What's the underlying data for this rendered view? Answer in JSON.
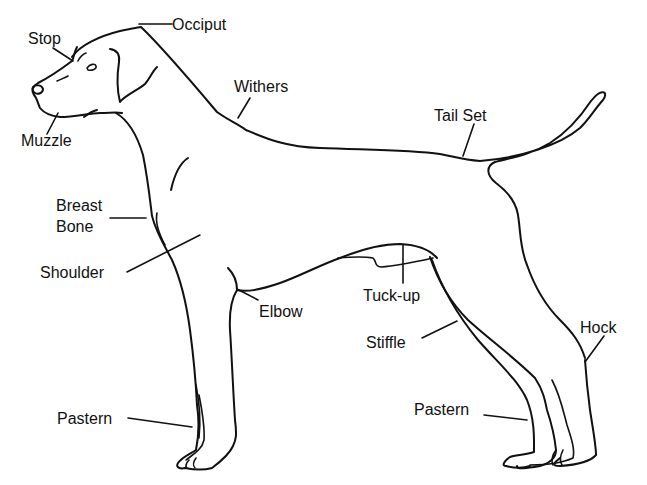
{
  "diagram": {
    "stroke_color": "#111111",
    "background": "#ffffff",
    "labels": [
      {
        "id": "stop",
        "text": "Stop",
        "x": 28,
        "y": 29
      },
      {
        "id": "occiput",
        "text": "Occiput",
        "x": 172,
        "y": 15
      },
      {
        "id": "withers",
        "text": "Withers",
        "x": 234,
        "y": 77
      },
      {
        "id": "muzzle",
        "text": "Muzzle",
        "x": 21,
        "y": 131
      },
      {
        "id": "tail-set",
        "text": "Tail Set",
        "x": 434,
        "y": 106
      },
      {
        "id": "breast-bone-line1",
        "text": "Breast",
        "x": 56,
        "y": 196
      },
      {
        "id": "breast-bone-line2",
        "text": "Bone",
        "x": 56,
        "y": 217
      },
      {
        "id": "shoulder",
        "text": "Shoulder",
        "x": 40,
        "y": 263
      },
      {
        "id": "elbow",
        "text": "Elbow",
        "x": 259,
        "y": 302
      },
      {
        "id": "tuck-up",
        "text": "Tuck-up",
        "x": 363,
        "y": 286
      },
      {
        "id": "stiffle",
        "text": "Stiffle",
        "x": 366,
        "y": 333
      },
      {
        "id": "hock",
        "text": "Hock",
        "x": 580,
        "y": 318
      },
      {
        "id": "pastern-front",
        "text": "Pastern",
        "x": 57,
        "y": 409
      },
      {
        "id": "pastern-rear",
        "text": "Pastern",
        "x": 414,
        "y": 400
      }
    ]
  }
}
